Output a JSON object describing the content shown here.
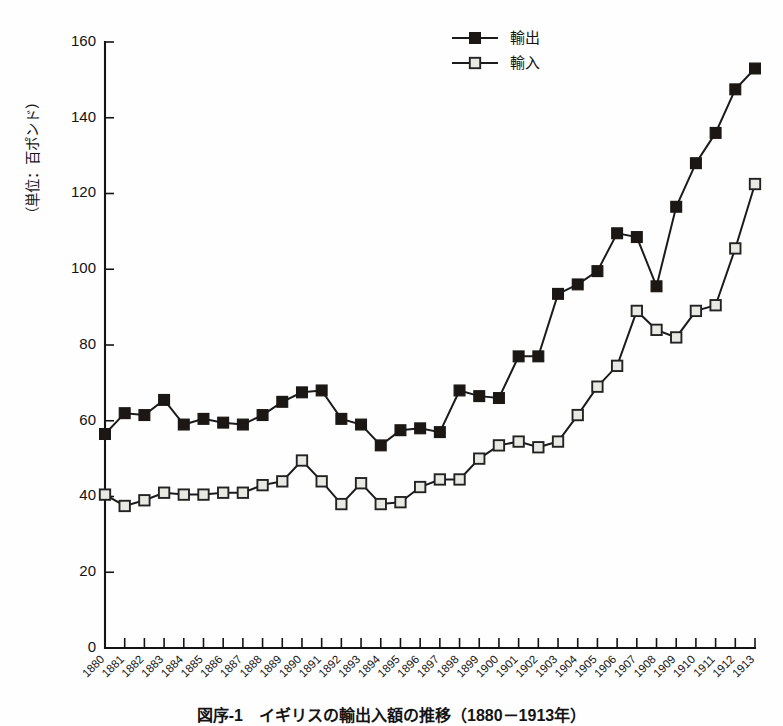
{
  "figure": {
    "caption": "図序-1　イギリスの輸出入額の推移（1880－1913年）",
    "y_axis_title": "（単位：百ポンド）"
  },
  "legend": {
    "position": "top-center",
    "entries": [
      {
        "label": "輸出",
        "marker": "filled-square-marker"
      },
      {
        "label": "輸入",
        "marker": "open-square-marker"
      }
    ]
  },
  "chart_data": {
    "type": "line",
    "title": "図序-1　イギリスの輸出入額の推移（1880－1913年）",
    "xlabel": "",
    "ylabel": "（単位：百ポンド）",
    "ylim": [
      0,
      160
    ],
    "yticks": [
      0,
      20,
      40,
      60,
      80,
      100,
      120,
      140,
      160
    ],
    "grid": false,
    "legend_position": "top-center",
    "categories": [
      "1880",
      "1881",
      "1882",
      "1883",
      "1884",
      "1885",
      "1886",
      "1887",
      "1888",
      "1889",
      "1890",
      "1891",
      "1892",
      "1893",
      "1894",
      "1895",
      "1896",
      "1897",
      "1898",
      "1899",
      "1900",
      "1901",
      "1902",
      "1903",
      "1904",
      "1905",
      "1906",
      "1907",
      "1908",
      "1909",
      "1910",
      "1911",
      "1912",
      "1913"
    ],
    "series": [
      {
        "name": "輸出",
        "marker": "filled-square",
        "values": [
          56.5,
          62.0,
          61.5,
          65.5,
          59.0,
          60.5,
          59.5,
          59.0,
          61.5,
          65.0,
          67.5,
          68.0,
          60.5,
          59.0,
          53.5,
          57.5,
          58.0,
          57.0,
          68.0,
          66.5,
          66.0,
          77.0,
          77.0,
          93.5,
          96.0,
          99.5,
          109.5,
          108.5,
          95.5,
          116.5,
          128.0,
          136.0,
          147.5,
          153.0
        ]
      },
      {
        "name": "輸入",
        "marker": "open-square",
        "values": [
          40.5,
          37.5,
          39.0,
          41.0,
          40.5,
          40.5,
          41.0,
          41.0,
          43.0,
          44.0,
          49.5,
          44.0,
          38.0,
          43.5,
          38.0,
          38.5,
          42.5,
          44.5,
          44.5,
          50.0,
          53.5,
          54.5,
          53.0,
          54.5,
          61.5,
          69.0,
          74.5,
          89.0,
          84.0,
          82.0,
          89.0,
          90.5,
          105.5,
          122.5
        ]
      }
    ]
  },
  "colors": {
    "export_marker": "#1b1714",
    "import_marker": "#e9e9e4",
    "line": "#1b1b1b",
    "axis": "#141414",
    "background": "#fefefe"
  }
}
